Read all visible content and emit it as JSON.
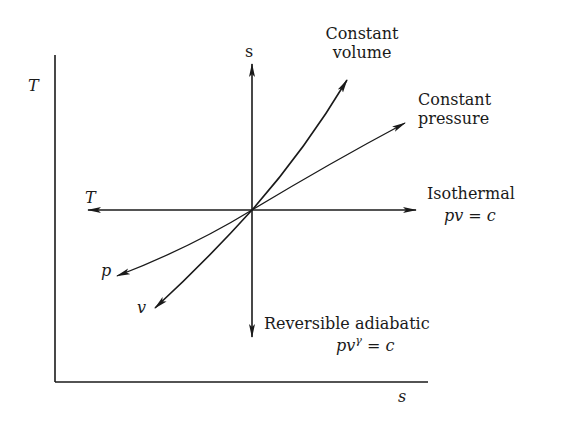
{
  "diagram": {
    "axes": {
      "vertical_label": "T",
      "horizontal_label": "s"
    },
    "origin_arrows": {
      "up_label": "s",
      "left_label": "T"
    },
    "processes": {
      "constant_volume": {
        "line1": "Constant",
        "line2": "volume"
      },
      "constant_pressure": {
        "line1": "Constant",
        "line2": "pressure"
      },
      "isothermal": {
        "line1": "Isothermal",
        "eq_main": "pv = c"
      },
      "adiabatic": {
        "line1": "Reversible adiabatic",
        "eq_base": "pv",
        "eq_exp": "γ",
        "eq_rest": " = c"
      },
      "p_branch": {
        "label": "p"
      },
      "v_branch": {
        "label": "v"
      }
    },
    "colors": {
      "ink": "#1a1a1a",
      "background": "#ffffff"
    }
  }
}
